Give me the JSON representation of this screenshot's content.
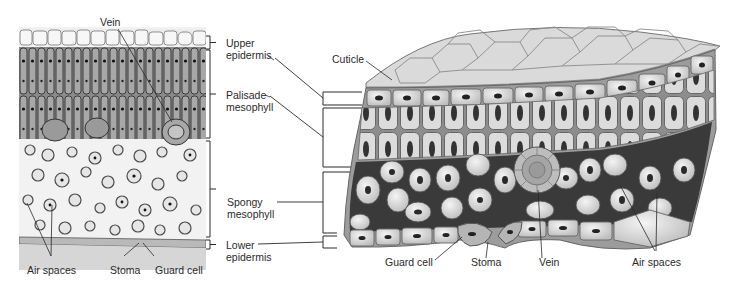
{
  "figure": {
    "left_panel": {
      "type": "micrograph",
      "subject": "leaf cross-section (light micrograph)",
      "labels": {
        "vein": "Vein",
        "air_spaces": "Air spaces",
        "stoma": "Stoma",
        "guard_cell": "Guard cell"
      }
    },
    "center_labels": {
      "upper_epidermis": [
        "Upper",
        "epidermis"
      ],
      "palisade_mesophyll": [
        "Palisade",
        "mesophyll"
      ],
      "spongy_mesophyll": [
        "Spongy",
        "mesophyll"
      ],
      "lower_epidermis": [
        "Lower",
        "epidermis"
      ]
    },
    "right_panel": {
      "type": "illustration",
      "subject": "3D leaf tissue block",
      "labels": {
        "cuticle": "Cuticle",
        "guard_cell": "Guard cell",
        "stoma": "Stoma",
        "vein": "Vein",
        "air_spaces": "Air spaces"
      }
    },
    "colors": {
      "line": "#2a2a2a",
      "cell_fill": "#e8e8e8",
      "cell_stroke": "#6e6e6e",
      "nucleus": "#2b2b2b",
      "air_space": "#3a3a3a",
      "cuticle": "#8a8a8a",
      "micrograph_bg": "#d9d9d9"
    }
  }
}
